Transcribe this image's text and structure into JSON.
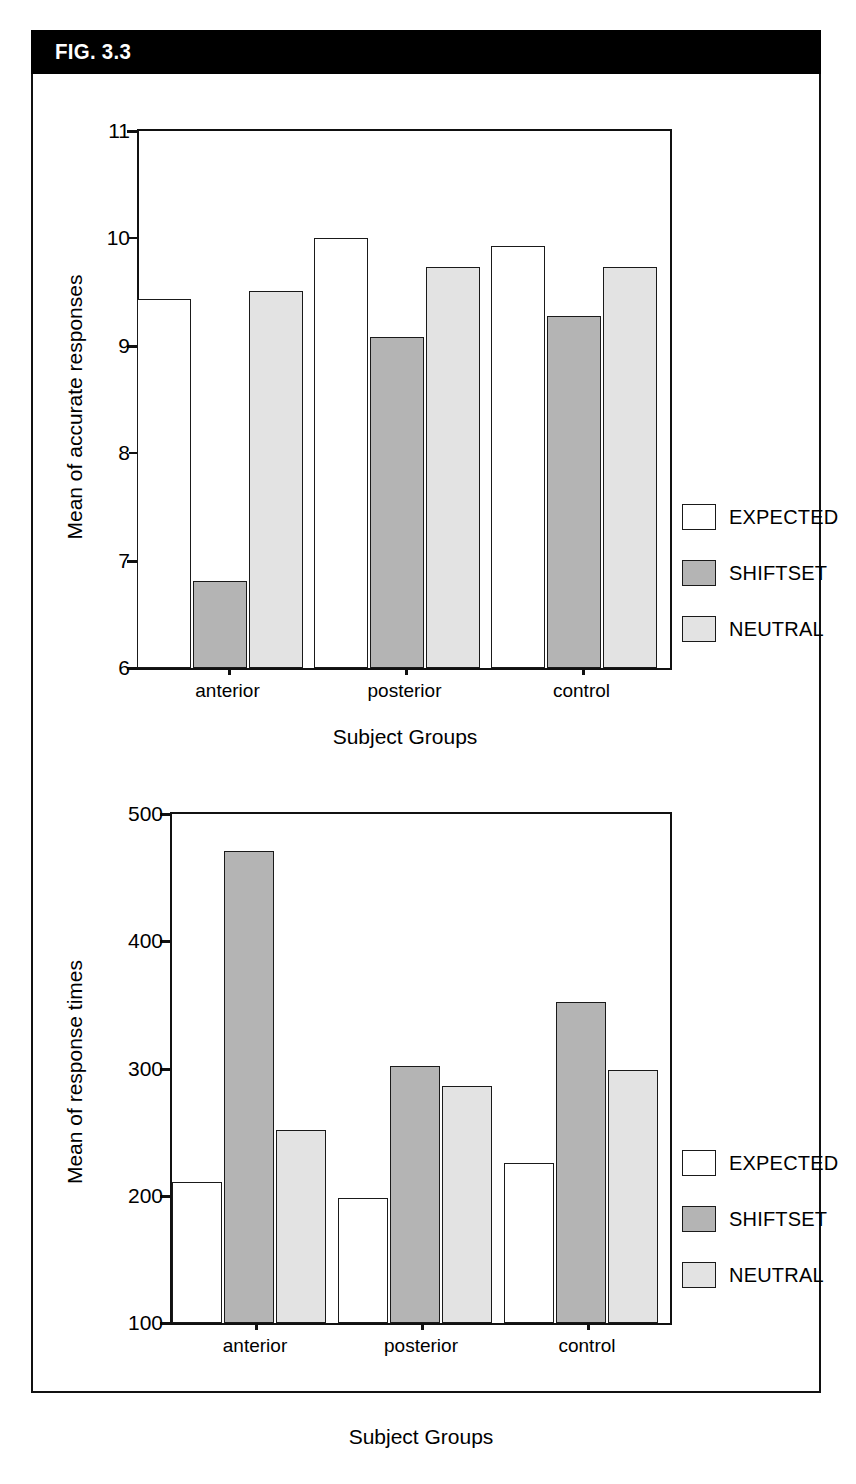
{
  "figure": {
    "label": "FIG. 3.3"
  },
  "legend": {
    "items": [
      {
        "name": "EXPECTED",
        "swatch": "expected",
        "color": "#ffffff"
      },
      {
        "name": "SHIFTSET",
        "swatch": "shiftset",
        "color": "#b4b4b4"
      },
      {
        "name": "NEUTRAL",
        "swatch": "neutral",
        "color": "#e3e3e3"
      }
    ]
  },
  "chart_data": [
    {
      "type": "bar",
      "id": "accuracy",
      "title": "",
      "xlabel": "Subject Groups",
      "ylabel": "Mean of accurate responses",
      "categories": [
        "anterior",
        "posterior",
        "control"
      ],
      "yticks": [
        6,
        7,
        8,
        9,
        10,
        11
      ],
      "ytick_labels": [
        "6",
        "7",
        "8",
        "9",
        "10",
        "11"
      ],
      "ylim": [
        6,
        11
      ],
      "grid": false,
      "legend_position": "right",
      "series": [
        {
          "name": "EXPECTED",
          "color": "#ffffff",
          "values": [
            9.44,
            10.0,
            9.93
          ]
        },
        {
          "name": "SHIFTSET",
          "color": "#b4b4b4",
          "values": [
            6.81,
            9.08,
            9.28
          ]
        },
        {
          "name": "NEUTRAL",
          "color": "#e3e3e3",
          "values": [
            9.51,
            9.73,
            9.73
          ]
        }
      ]
    },
    {
      "type": "bar",
      "id": "response-times",
      "title": "",
      "xlabel": "Subject Groups",
      "ylabel": "Mean of response times",
      "categories": [
        "anterior",
        "posterior",
        "control"
      ],
      "yticks": [
        100,
        200,
        300,
        400,
        500
      ],
      "ytick_labels": [
        "100",
        "200",
        "300",
        "400",
        "500"
      ],
      "ylim": [
        100,
        500
      ],
      "grid": false,
      "legend_position": "right",
      "series": [
        {
          "name": "EXPECTED",
          "color": "#ffffff",
          "values": [
            211,
            198,
            226
          ]
        },
        {
          "name": "SHIFTSET",
          "color": "#b4b4b4",
          "values": [
            471,
            302,
            352
          ]
        },
        {
          "name": "NEUTRAL",
          "color": "#e3e3e3",
          "values": [
            252,
            286,
            299
          ]
        }
      ]
    }
  ]
}
